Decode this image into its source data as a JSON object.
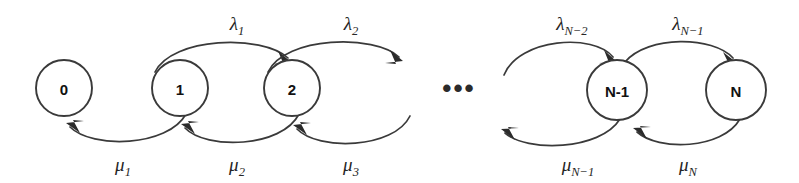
{
  "figure": {
    "type": "state-transition-diagram",
    "title": "",
    "background_color": "#ffffff",
    "stroke_color": "#3a3a3a",
    "text_color": "#111111"
  },
  "states": [
    {
      "id": "s0",
      "label": "0",
      "cx": 64,
      "cy": 88,
      "r": 28
    },
    {
      "id": "s1",
      "label": "1",
      "cx": 180,
      "cy": 88,
      "r": 28
    },
    {
      "id": "s2",
      "label": "2",
      "cx": 292,
      "cy": 88,
      "r": 28
    },
    {
      "id": "sn1",
      "label": "N-1",
      "cx": 617,
      "cy": 90,
      "r": 30
    },
    {
      "id": "sn",
      "label": "N",
      "cx": 736,
      "cy": 90,
      "r": 30
    }
  ],
  "ellipsis": {
    "text": "•••",
    "cx": 459,
    "cy": 87
  },
  "forward_rates": [
    {
      "id": "lambda1",
      "base": "λ",
      "sub": "1",
      "text": "λ₁",
      "x": 237,
      "y": 28,
      "from": "1",
      "to": "2"
    },
    {
      "id": "lambda2",
      "base": "λ",
      "sub": "2",
      "text": "λ₂",
      "x": 351,
      "y": 28,
      "from": "2",
      "to": "3"
    },
    {
      "id": "lambdaN2",
      "base": "λ",
      "sub": "N−2",
      "text": "λₙ₋₂",
      "x": 572,
      "y": 28,
      "from": "N-2",
      "to": "N-1"
    },
    {
      "id": "lambdaN1",
      "base": "λ",
      "sub": "N−1",
      "text": "λₙ₋₁",
      "x": 688,
      "y": 28,
      "from": "N-1",
      "to": "N"
    }
  ],
  "backward_rates": [
    {
      "id": "mu1",
      "base": "μ",
      "sub": "1",
      "text": "μ₁",
      "x": 123,
      "y": 169,
      "from": "1",
      "to": "0"
    },
    {
      "id": "mu2",
      "base": "μ",
      "sub": "2",
      "text": "μ₂",
      "x": 237,
      "y": 169,
      "from": "2",
      "to": "1"
    },
    {
      "id": "mu3",
      "base": "μ",
      "sub": "3",
      "text": "μ₃",
      "x": 351,
      "y": 169,
      "from": "3",
      "to": "2"
    },
    {
      "id": "muN1",
      "base": "μ",
      "sub": "N−1",
      "text": "μₙ₋₁",
      "x": 578,
      "y": 169,
      "from": "N-1",
      "to": "N-2"
    },
    {
      "id": "muN",
      "base": "μ",
      "sub": "N",
      "text": "μₙ",
      "x": 688,
      "y": 169,
      "from": "N",
      "to": "N-1"
    }
  ]
}
